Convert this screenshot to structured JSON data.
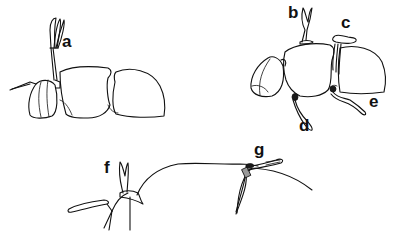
{
  "diagram": {
    "background": "#ffffff",
    "stroke_color": "#111111",
    "figures": [
      {
        "id": "figure-1",
        "description": "lateral view of body with single appendage",
        "labels": [
          {
            "text": "a",
            "x": 62,
            "y": 33
          }
        ]
      },
      {
        "id": "figure-2",
        "description": "lateral view of body with multiple appendages",
        "labels": [
          {
            "text": "b",
            "x": 288,
            "y": 5
          },
          {
            "text": "c",
            "x": 341,
            "y": 15
          },
          {
            "text": "d",
            "x": 299,
            "y": 118
          },
          {
            "text": "e",
            "x": 369,
            "y": 94
          }
        ]
      },
      {
        "id": "figure-3",
        "description": "close-up view of head outline with appendages",
        "labels": [
          {
            "text": "f",
            "x": 103,
            "y": 160
          },
          {
            "text": "g",
            "x": 255,
            "y": 142
          }
        ]
      }
    ]
  }
}
